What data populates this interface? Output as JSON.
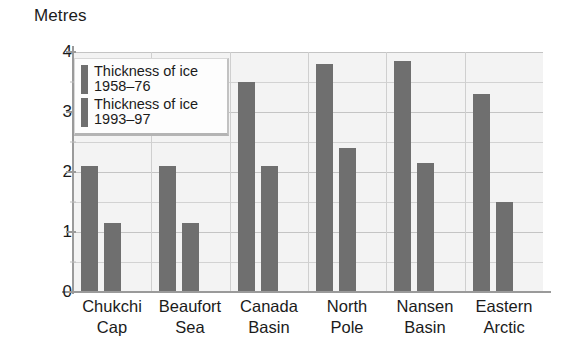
{
  "chart_data": {
    "type": "bar",
    "title": "",
    "xlabel": "",
    "ylabel": "Metres",
    "ylim": [
      0,
      4
    ],
    "y_ticks": [
      0,
      1,
      2,
      3,
      4
    ],
    "y_tick_labels": [
      "0",
      "1",
      "2",
      "3",
      "4"
    ],
    "y_minor_ticks": [
      0.5,
      1.5,
      2.5,
      3.5
    ],
    "grid": true,
    "legend_position": "upper-left-inside",
    "bar_color": "#6f6f6f",
    "plot_background": "#f3f3f3",
    "gridline_color": "#d2d2d2",
    "categories": [
      "Chukchi Cap",
      "Beaufort Sea",
      "Canada Basin",
      "North Pole",
      "Nansen Basin",
      "Eastern Arctic"
    ],
    "category_lines": [
      [
        "Chukchi",
        "Cap"
      ],
      [
        "Beaufort",
        "Sea"
      ],
      [
        "Canada",
        "Basin"
      ],
      [
        "North",
        "Pole"
      ],
      [
        "Nansen",
        "Basin"
      ],
      [
        "Eastern",
        "Arctic"
      ]
    ],
    "series": [
      {
        "name": "Thickness of ice 1958–76",
        "legend_lines": [
          "Thickness of ice",
          "1958–76"
        ],
        "values": [
          2.1,
          2.1,
          3.5,
          3.8,
          3.85,
          3.3
        ]
      },
      {
        "name": "Thickness of ice 1993–97",
        "legend_lines": [
          "Thickness of ice",
          "1993–97"
        ],
        "values": [
          1.15,
          1.15,
          2.1,
          2.4,
          2.15,
          1.5
        ]
      }
    ]
  }
}
